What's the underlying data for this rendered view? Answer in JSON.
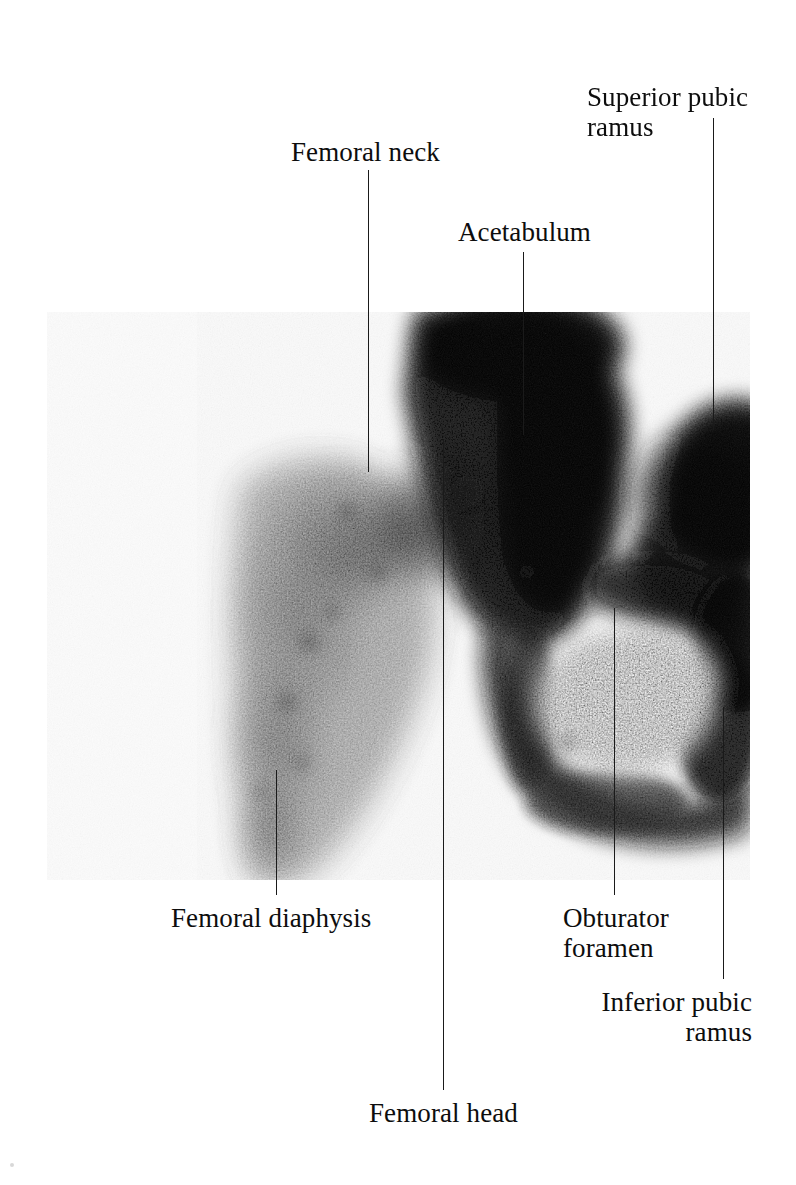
{
  "figure": {
    "kind": "bone-scintigram",
    "region": "hip and pelvis",
    "modality": "radionuclide bone scan",
    "plate": {
      "left": 47,
      "top": 312,
      "width": 703,
      "height": 568,
      "background_hex": "#fbfbfb",
      "tracer_hex": "#111111"
    }
  },
  "labels": [
    {
      "id": "femoral-neck",
      "text": "Femoral neck",
      "left": 291,
      "top": 137,
      "align": "left",
      "leader": {
        "x": 368,
        "top": 170,
        "height": 302
      }
    },
    {
      "id": "superior-pubic-ramus",
      "text": "Superior pubic\nramus",
      "left": 587,
      "top": 82,
      "align": "left",
      "leader": {
        "x": 713,
        "top": 118,
        "height": 312
      }
    },
    {
      "id": "acetabulum",
      "text": "Acetabulum",
      "left": 458,
      "top": 217,
      "align": "left",
      "leader": {
        "x": 523,
        "top": 252,
        "height": 183
      }
    },
    {
      "id": "femoral-diaphysis",
      "text": "Femoral diaphysis",
      "left": 171,
      "top": 903,
      "align": "left",
      "leader": {
        "x": 276,
        "top": 770,
        "height": 125
      }
    },
    {
      "id": "obturator-foramen",
      "text": "Obturator\nforamen",
      "left": 563,
      "top": 903,
      "align": "left",
      "leader": {
        "x": 614,
        "top": 608,
        "height": 287
      }
    },
    {
      "id": "inferior-pubic-ramus",
      "text": "Inferior pubic\nramus",
      "left": 600,
      "top": 987,
      "align": "right",
      "width": 152,
      "leader": {
        "x": 723,
        "top": 707,
        "height": 272
      }
    },
    {
      "id": "femoral-head",
      "text": "Femoral head",
      "left": 369,
      "top": 1098,
      "align": "left",
      "leader": {
        "x": 443,
        "top": 440,
        "height": 650
      }
    }
  ]
}
